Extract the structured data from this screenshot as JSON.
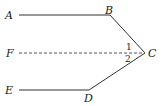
{
  "diagram": {
    "type": "geometry",
    "points": {
      "A": {
        "label": "A",
        "x": 19,
        "y": 15
      },
      "B": {
        "label": "B",
        "x": 110,
        "y": 15
      },
      "C": {
        "label": "C",
        "x": 145,
        "y": 53
      },
      "D": {
        "label": "D",
        "x": 89,
        "y": 90
      },
      "E": {
        "label": "E",
        "x": 19,
        "y": 90
      },
      "F": {
        "label": "F",
        "x": 19,
        "y": 53
      }
    },
    "segments": [
      {
        "from": "A",
        "to": "B",
        "style": "solid"
      },
      {
        "from": "B",
        "to": "C",
        "style": "solid"
      },
      {
        "from": "C",
        "to": "D",
        "style": "solid"
      },
      {
        "from": "D",
        "to": "E",
        "style": "solid"
      },
      {
        "from": "F",
        "to": "C",
        "style": "dashed"
      }
    ],
    "angles": [
      {
        "label": "1",
        "between": "BC-CF"
      },
      {
        "label": "2",
        "between": "FC-CD"
      }
    ],
    "line_color": "#333333"
  }
}
